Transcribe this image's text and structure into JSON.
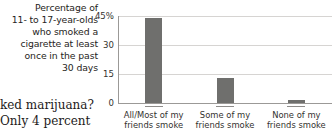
{
  "caption": {
    "lines": [
      "Percentage of",
      "11- to 17-year-olds",
      "who smoked a",
      "cigarette at least",
      "once in the past",
      "30 days"
    ]
  },
  "body_text": {
    "lines": [
      "ked marijuana?",
      "Only 4 percent"
    ]
  },
  "chart_data": {
    "type": "bar",
    "title": "Percentage of 11- to 17-year-olds who smoked a cigarette at least once in the past 30 days",
    "xlabel": "",
    "ylabel": "",
    "categories": [
      "All/Most of my friends smoke",
      "Some of my friends smoke",
      "None of my friends smoke"
    ],
    "category_lines": [
      [
        "All/Most of my",
        "friends smoke"
      ],
      [
        "Some of my",
        "friends smoke"
      ],
      [
        "None of my",
        "friends smoke"
      ]
    ],
    "values": [
      44,
      13,
      1.5
    ],
    "ylim": [
      0,
      45
    ],
    "yticks": [
      0,
      15,
      30,
      45
    ],
    "ytick_labels": [
      "0",
      "15",
      "30",
      "45%"
    ],
    "grid": true,
    "legend": "none",
    "bar_color": "#6f6f6d",
    "grid_color": "#d6d4d2",
    "axis_color": "#9b9997"
  }
}
